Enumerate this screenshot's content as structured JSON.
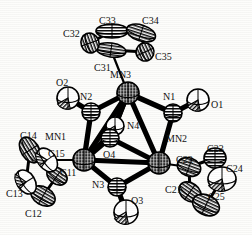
{
  "figure": {
    "kind": "ortep-thermal-ellipsoid-plot",
    "background_color": "#fdfdfb",
    "line_color": "#000000",
    "label_color": "#111111"
  },
  "atoms": [
    {
      "id": "MN1",
      "label": "MN1",
      "element": "Mn",
      "kind": "metal",
      "x": 84,
      "y": 160,
      "r": 11,
      "fill": "crosshatch-dark",
      "label_x": 45,
      "label_y": 132
    },
    {
      "id": "MN2",
      "label": "MN2",
      "element": "Mn",
      "kind": "metal",
      "x": 159,
      "y": 163,
      "r": 11,
      "fill": "crosshatch-dark",
      "label_x": 166,
      "label_y": 134
    },
    {
      "id": "MN3",
      "label": "MN3",
      "element": "Mn",
      "kind": "metal",
      "x": 128,
      "y": 93,
      "r": 11,
      "fill": "crosshatch-dark",
      "label_x": 110,
      "label_y": 70
    },
    {
      "id": "N1",
      "label": "N1",
      "element": "N",
      "kind": "nitrogen",
      "x": 173,
      "y": 113,
      "r": 9,
      "fill": "hatch-dark",
      "label_x": 163,
      "label_y": 92
    },
    {
      "id": "N2",
      "label": "N2",
      "element": "N",
      "kind": "nitrogen",
      "x": 91,
      "y": 112,
      "r": 9,
      "fill": "hatch-dark",
      "label_x": 80,
      "label_y": 92
    },
    {
      "id": "N3",
      "label": "N3",
      "element": "N",
      "kind": "nitrogen",
      "x": 117,
      "y": 187,
      "r": 9,
      "fill": "hatch-dark",
      "label_x": 92,
      "label_y": 180
    },
    {
      "id": "N4",
      "label": "N4",
      "element": "N",
      "kind": "nitrogen",
      "x": 115,
      "y": 126,
      "r": 9,
      "fill": "light",
      "label_x": 127,
      "label_y": 121
    },
    {
      "id": "O1",
      "label": "O1",
      "element": "O",
      "kind": "oxygen",
      "x": 198,
      "y": 100,
      "r": 11,
      "fill": "wedge-light",
      "label_x": 211,
      "label_y": 100
    },
    {
      "id": "O2",
      "label": "O2",
      "element": "O",
      "kind": "oxygen",
      "x": 68,
      "y": 98,
      "r": 11,
      "fill": "wedge-light",
      "label_x": 56,
      "label_y": 78
    },
    {
      "id": "O3",
      "label": "O3",
      "element": "O",
      "kind": "oxygen",
      "x": 126,
      "y": 212,
      "r": 12,
      "fill": "wedge-light",
      "label_x": 131,
      "label_y": 196
    },
    {
      "id": "O4",
      "label": "O4",
      "element": "O",
      "kind": "oxygen",
      "x": 110,
      "y": 138,
      "r": 9,
      "fill": "hatch-dark",
      "label_x": 103,
      "label_y": 150
    },
    {
      "id": "C11",
      "label": "C11",
      "element": "C",
      "kind": "carbon",
      "x": 57,
      "y": 176,
      "rx": 11,
      "ry": 8,
      "rot": 35,
      "fill": "hatch-dark",
      "label_x": 60,
      "label_y": 168
    },
    {
      "id": "C12",
      "label": "C12",
      "element": "C",
      "kind": "carbon",
      "x": 43,
      "y": 196,
      "rx": 13,
      "ry": 9,
      "rot": 30,
      "fill": "hatch-dark",
      "label_x": 25,
      "label_y": 209
    },
    {
      "id": "C13",
      "label": "C13",
      "element": "C",
      "kind": "carbon",
      "x": 26,
      "y": 182,
      "rx": 13,
      "ry": 9,
      "rot": 58,
      "fill": "light",
      "label_x": 6,
      "label_y": 189
    },
    {
      "id": "C14",
      "label": "C14",
      "element": "C",
      "kind": "carbon",
      "x": 30,
      "y": 150,
      "rx": 14,
      "ry": 9,
      "rot": 58,
      "fill": "hatch-dark",
      "label_x": 20,
      "label_y": 131
    },
    {
      "id": "C15",
      "label": "C15",
      "element": "C",
      "kind": "carbon",
      "x": 47,
      "y": 160,
      "rx": 13,
      "ry": 9,
      "rot": 55,
      "fill": "light",
      "label_x": 48,
      "label_y": 149
    },
    {
      "id": "C21",
      "label": "C21",
      "element": "C",
      "kind": "carbon",
      "x": 190,
      "y": 192,
      "rx": 12,
      "ry": 9,
      "rot": 35,
      "fill": "hatch-dark",
      "label_x": 165,
      "label_y": 185
    },
    {
      "id": "C22",
      "label": "C22",
      "element": "C",
      "kind": "carbon",
      "x": 189,
      "y": 167,
      "rx": 12,
      "ry": 9,
      "rot": 20,
      "fill": "hatch-dark",
      "label_x": 176,
      "label_y": 155
    },
    {
      "id": "C23",
      "label": "C23",
      "element": "C",
      "kind": "carbon",
      "x": 215,
      "y": 158,
      "rx": 11,
      "ry": 10,
      "rot": 0,
      "fill": "hatch-dark",
      "label_x": 207,
      "label_y": 144
    },
    {
      "id": "C24",
      "label": "C24",
      "element": "C",
      "kind": "carbon",
      "x": 222,
      "y": 179,
      "rx": 14,
      "ry": 12,
      "rot": 0,
      "fill": "wedge-light",
      "label_x": 226,
      "label_y": 164
    },
    {
      "id": "C25",
      "label": "C25",
      "element": "C",
      "kind": "carbon",
      "x": 206,
      "y": 205,
      "rx": 14,
      "ry": 10,
      "rot": 25,
      "fill": "hatch-dark",
      "label_x": 208,
      "label_y": 192
    },
    {
      "id": "C31",
      "label": "C31",
      "element": "C",
      "kind": "carbon",
      "x": 111,
      "y": 50,
      "rx": 15,
      "ry": 7,
      "rot": 8,
      "fill": "hatch-dark",
      "label_x": 94,
      "label_y": 63
    },
    {
      "id": "C32",
      "label": "C32",
      "element": "C",
      "kind": "carbon",
      "x": 90,
      "y": 43,
      "rx": 10,
      "ry": 9,
      "rot": 70,
      "fill": "hatch-dark",
      "label_x": 63,
      "label_y": 29
    },
    {
      "id": "C33",
      "label": "C33",
      "element": "C",
      "kind": "carbon",
      "x": 112,
      "y": 31,
      "rx": 16,
      "ry": 7,
      "rot": 0,
      "fill": "hatch-dark",
      "label_x": 99,
      "label_y": 16
    },
    {
      "id": "C34",
      "label": "C34",
      "element": "C",
      "kind": "carbon",
      "x": 141,
      "y": 33,
      "rx": 15,
      "ry": 8,
      "rot": 18,
      "fill": "hatch-dark",
      "label_x": 142,
      "label_y": 16
    },
    {
      "id": "C35",
      "label": "C35",
      "element": "C",
      "kind": "carbon",
      "x": 145,
      "y": 52,
      "rx": 9,
      "ry": 9,
      "rot": 65,
      "fill": "hatch-dark",
      "label_x": 155,
      "label_y": 52
    }
  ],
  "bonds": [
    {
      "from": "MN1",
      "to": "MN2",
      "style": "thick"
    },
    {
      "from": "MN1",
      "to": "MN3",
      "style": "thick"
    },
    {
      "from": "MN2",
      "to": "MN3",
      "style": "thick"
    },
    {
      "from": "MN3",
      "to": "N2",
      "style": "thick"
    },
    {
      "from": "MN1",
      "to": "N2",
      "style": "thick"
    },
    {
      "from": "N2",
      "to": "O2",
      "style": "thick"
    },
    {
      "from": "MN3",
      "to": "N1",
      "style": "thick"
    },
    {
      "from": "MN2",
      "to": "N1",
      "style": "thick"
    },
    {
      "from": "N1",
      "to": "O1",
      "style": "thick"
    },
    {
      "from": "MN1",
      "to": "N3",
      "style": "thick"
    },
    {
      "from": "MN2",
      "to": "N3",
      "style": "thick"
    },
    {
      "from": "N3",
      "to": "O3",
      "style": "thick"
    },
    {
      "from": "MN3",
      "to": "N4",
      "style": "thick"
    },
    {
      "from": "MN1",
      "to": "N4",
      "style": "thin"
    },
    {
      "from": "MN3",
      "to": "O4",
      "style": "thick"
    },
    {
      "from": "MN1",
      "to": "O4",
      "style": "thick"
    },
    {
      "from": "MN2",
      "to": "O4",
      "style": "thick"
    },
    {
      "from": "N4",
      "to": "O4",
      "style": "thin"
    },
    {
      "from": "C11",
      "to": "C12",
      "style": "ring"
    },
    {
      "from": "C12",
      "to": "C13",
      "style": "ring"
    },
    {
      "from": "C13",
      "to": "C14",
      "style": "ring"
    },
    {
      "from": "C14",
      "to": "C15",
      "style": "ring"
    },
    {
      "from": "C15",
      "to": "C11",
      "style": "ring"
    },
    {
      "from": "C21",
      "to": "C22",
      "style": "ring"
    },
    {
      "from": "C22",
      "to": "C23",
      "style": "ring"
    },
    {
      "from": "C23",
      "to": "C24",
      "style": "ring"
    },
    {
      "from": "C24",
      "to": "C25",
      "style": "ring"
    },
    {
      "from": "C25",
      "to": "C21",
      "style": "ring"
    },
    {
      "from": "C31",
      "to": "C32",
      "style": "ring"
    },
    {
      "from": "C32",
      "to": "C33",
      "style": "ring"
    },
    {
      "from": "C33",
      "to": "C34",
      "style": "ring"
    },
    {
      "from": "C34",
      "to": "C35",
      "style": "ring"
    },
    {
      "from": "C35",
      "to": "C31",
      "style": "ring"
    },
    {
      "from": "MN1",
      "to": "C15",
      "style": "thin"
    },
    {
      "from": "MN2",
      "to": "C22",
      "style": "thin"
    },
    {
      "from": "MN3",
      "to": "C31",
      "style": "thin"
    }
  ]
}
